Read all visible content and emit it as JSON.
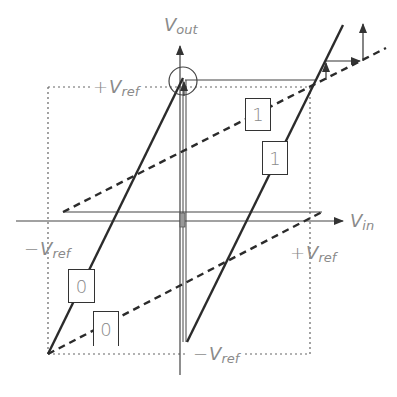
{
  "diagram": {
    "axes": {
      "y_label": {
        "main": "V",
        "sub": "out"
      },
      "x_label": {
        "main": "V",
        "sub": "in"
      }
    },
    "labels": {
      "plus_vref_top": {
        "sign": "+",
        "main": "V",
        "sub": "ref"
      },
      "minus_vref_left": {
        "sign": "−",
        "main": "V",
        "sub": "ref"
      },
      "plus_vref_right": {
        "sign": "+",
        "main": "V",
        "sub": "ref"
      },
      "minus_vref_bottom": {
        "sign": "−",
        "main": "V",
        "sub": "ref"
      }
    },
    "bit_boxes": [
      {
        "id": "upper-dashed-1",
        "value": "1"
      },
      {
        "id": "upper-solid-1",
        "value": "1"
      },
      {
        "id": "lower-solid-0",
        "value": "0"
      },
      {
        "id": "lower-dashed-0",
        "value": "0"
      }
    ],
    "colors": {
      "line": "#2b2b2b",
      "axis": "#444444",
      "label": "#8a8a8a",
      "dotted_box": "#666666"
    }
  }
}
